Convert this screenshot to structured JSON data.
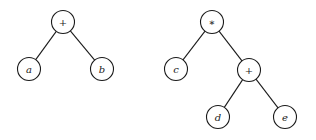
{
  "diagram": {
    "type": "expression-trees",
    "radius": 11.5,
    "colors": {
      "stroke": "#1a1a1a",
      "fill": "#ffffff",
      "background": "#ffffff"
    },
    "trees": [
      {
        "name": "tree-a-plus-b",
        "nodes": [
          {
            "id": "t1_plus",
            "label": "+",
            "kind": "operator",
            "x": 63,
            "y": 22
          },
          {
            "id": "t1_a",
            "label": "a",
            "kind": "operand",
            "x": 29,
            "y": 69
          },
          {
            "id": "t1_b",
            "label": "b",
            "kind": "operand",
            "x": 102,
            "y": 69
          }
        ],
        "edges": [
          {
            "from": "t1_plus",
            "to": "t1_a"
          },
          {
            "from": "t1_plus",
            "to": "t1_b"
          }
        ]
      },
      {
        "name": "tree-c-times-d-plus-e",
        "nodes": [
          {
            "id": "t2_times",
            "label": "∗",
            "kind": "operator",
            "x": 212,
            "y": 22
          },
          {
            "id": "t2_c",
            "label": "c",
            "kind": "operand",
            "x": 176,
            "y": 69
          },
          {
            "id": "t2_plus",
            "label": "+",
            "kind": "operator",
            "x": 249,
            "y": 70
          },
          {
            "id": "t2_d",
            "label": "d",
            "kind": "operand",
            "x": 218,
            "y": 117
          },
          {
            "id": "t2_e",
            "label": "e",
            "kind": "operand",
            "x": 285,
            "y": 117
          }
        ],
        "edges": [
          {
            "from": "t2_times",
            "to": "t2_c"
          },
          {
            "from": "t2_times",
            "to": "t2_plus"
          },
          {
            "from": "t2_plus",
            "to": "t2_d"
          },
          {
            "from": "t2_plus",
            "to": "t2_e"
          }
        ]
      }
    ]
  }
}
